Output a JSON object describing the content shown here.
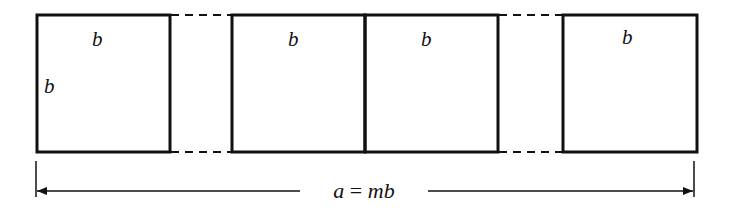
{
  "diagram": {
    "squares": [
      {
        "id": 1,
        "top_label": "b",
        "side_label": "b"
      },
      {
        "id": 2,
        "top_label": "b"
      },
      {
        "id": 3,
        "top_label": "b"
      },
      {
        "id": 4,
        "top_label": "b"
      }
    ],
    "gaps": [
      "dashed-continuation",
      "dashed-continuation"
    ],
    "dimension": {
      "label_var": "a",
      "label_eq": " = ",
      "label_rhs": "mb",
      "full_label": "a = mb"
    },
    "colors": {
      "stroke": "#111111",
      "background": "#ffffff"
    }
  }
}
